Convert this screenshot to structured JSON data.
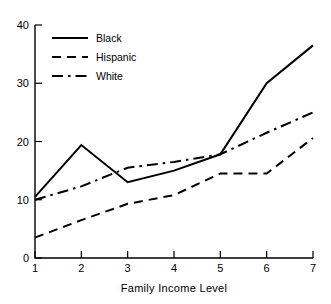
{
  "chart_data": {
    "type": "line",
    "title": "",
    "xlabel": "Family Income Level",
    "ylabel": "",
    "x": [
      1,
      2,
      3,
      4,
      5,
      6,
      7
    ],
    "categories": [
      "1",
      "2",
      "3",
      "4",
      "5",
      "6",
      "7"
    ],
    "xlim": [
      1,
      7
    ],
    "ylim": [
      0,
      40
    ],
    "yticks": [
      0,
      10,
      20,
      30,
      40
    ],
    "ytick_labels": [
      "0",
      "10",
      "20",
      "30",
      "40"
    ],
    "xticks": [
      1,
      2,
      3,
      4,
      5,
      6,
      7
    ],
    "xtick_labels": [
      "1",
      "2",
      "3",
      "4",
      "5",
      "6",
      "7"
    ],
    "grid": false,
    "legend_position": "upper-left",
    "series": [
      {
        "name": "Black",
        "style": "solid",
        "values": [
          10.5,
          19.4,
          13.0,
          15.0,
          17.8,
          30.0,
          36.5
        ]
      },
      {
        "name": "Hispanic",
        "style": "dashed",
        "values": [
          3.5,
          6.5,
          9.3,
          10.8,
          14.5,
          14.5,
          20.6
        ]
      },
      {
        "name": "White",
        "style": "dash-dot",
        "values": [
          10.0,
          12.3,
          15.5,
          16.5,
          17.8,
          21.5,
          25.0
        ]
      }
    ]
  },
  "axes": {
    "x_title": "Family Income Level",
    "y_tick_0": "0",
    "y_tick_1": "10",
    "y_tick_2": "20",
    "y_tick_3": "30",
    "y_tick_4": "40",
    "x_tick_1": "1",
    "x_tick_2": "2",
    "x_tick_3": "3",
    "x_tick_4": "4",
    "x_tick_5": "5",
    "x_tick_6": "6",
    "x_tick_7": "7"
  },
  "legend": {
    "entries": [
      {
        "label": "Black",
        "style": "solid"
      },
      {
        "label": "Hispanic",
        "style": "dashed"
      },
      {
        "label": "White",
        "style": "dash-dot"
      }
    ]
  },
  "colors": {
    "ink": "#000000",
    "background": "#ffffff"
  }
}
